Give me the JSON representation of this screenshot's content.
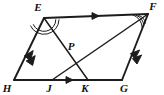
{
  "figure": {
    "background_color": "#ffffff",
    "stroke_color": "#1c1c1c",
    "label_color": "#111111"
  },
  "points": [
    {
      "id": "E",
      "label": "E",
      "x": 44,
      "y": 18,
      "label_x": 38,
      "label_y": 11,
      "name": "vertex-e"
    },
    {
      "id": "F",
      "label": "F",
      "x": 148,
      "y": 14,
      "label_x": 151,
      "label_y": 10,
      "name": "vertex-f"
    },
    {
      "id": "G",
      "label": "G",
      "x": 122,
      "y": 80,
      "label_x": 122,
      "label_y": 92,
      "name": "vertex-g"
    },
    {
      "id": "H",
      "label": "H",
      "x": 14,
      "y": 80,
      "label_x": 4,
      "label_y": 92,
      "name": "vertex-h"
    },
    {
      "id": "J",
      "label": "J",
      "x": 52,
      "y": 80,
      "label_x": 48,
      "label_y": 92,
      "name": "point-j"
    },
    {
      "id": "K",
      "label": "K",
      "x": 88,
      "y": 80,
      "label_x": 83,
      "label_y": 92,
      "name": "point-k"
    },
    {
      "id": "P",
      "label": "P",
      "x": 70,
      "y": 52,
      "label_x": 70,
      "label_y": 50,
      "name": "point-p"
    }
  ],
  "segments": [
    {
      "id": "EF",
      "from": "E",
      "to": "F",
      "name": "segment-ef",
      "weight": "outer"
    },
    {
      "id": "FG",
      "from": "F",
      "to": "G",
      "name": "segment-fg",
      "weight": "outer"
    },
    {
      "id": "HG",
      "from": "H",
      "to": "G",
      "name": "segment-hg",
      "weight": "outer"
    },
    {
      "id": "EH",
      "from": "E",
      "to": "H",
      "name": "segment-eh",
      "weight": "outer"
    },
    {
      "id": "EK",
      "from": "E",
      "to": "K",
      "name": "segment-ek",
      "weight": "inner"
    },
    {
      "id": "JF",
      "from": "J",
      "to": "F",
      "name": "segment-jf",
      "weight": "inner"
    }
  ],
  "tick_marks": [
    {
      "on": "EF",
      "position": 0.5,
      "count": 1,
      "style": "arrow",
      "name": "arrow-tick-ef"
    },
    {
      "on": "JK",
      "position": 0.5,
      "count": 1,
      "style": "arrow",
      "name": "arrow-tick-jk"
    },
    {
      "on": "EH",
      "position": 0.5,
      "count": 2,
      "style": "arrow",
      "name": "double-arrow-tick-eh"
    },
    {
      "on": "FG",
      "position": 0.5,
      "count": 2,
      "style": "arrow",
      "name": "double-arrow-tick-fg"
    }
  ],
  "angle_marks": [
    {
      "at": "E",
      "count": 2,
      "name": "angle-arc-e",
      "description": "double arc at vertex E between EF/EH and EK"
    },
    {
      "at": "F",
      "count": 2,
      "name": "angle-arc-f",
      "description": "double arc at vertex F between EF and FJ/FG"
    }
  ],
  "parallel_sets": [
    {
      "members": [
        "EF",
        "JK"
      ],
      "marks": 1
    },
    {
      "members": [
        "EH",
        "FG"
      ],
      "marks": 2
    }
  ]
}
